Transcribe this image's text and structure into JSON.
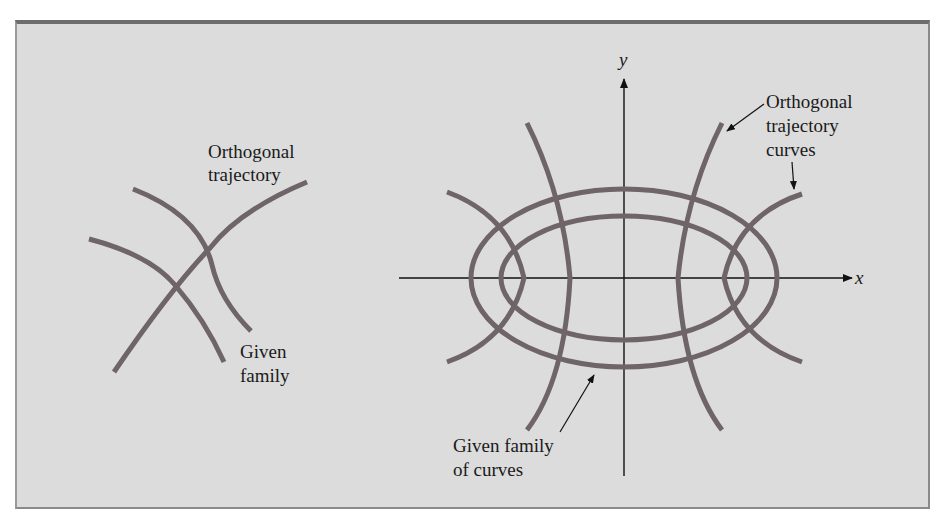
{
  "figure": {
    "left_diagram": {
      "labels": {
        "orthogonal_line1": "Orthogonal",
        "orthogonal_line2": "trajectory",
        "given_line1": "Given",
        "given_line2": "family"
      }
    },
    "right_diagram": {
      "axes": {
        "x_label": "x",
        "y_label": "y"
      },
      "labels": {
        "orthogonal_curves_line1": "Orthogonal",
        "orthogonal_curves_line2": "trajectory",
        "orthogonal_curves_line3": "curves",
        "given_family_line1": "Given family",
        "given_family_line2": "of curves"
      }
    },
    "colors": {
      "background": "#dcdcdc",
      "curve": "#6f6468",
      "border_top": "#6d6d6d",
      "text": "#1a1a1a"
    }
  }
}
